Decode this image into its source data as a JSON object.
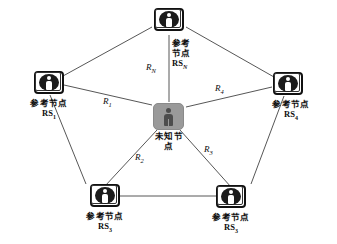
{
  "diagram": {
    "center_node": {
      "icon": "unknown-person-icon",
      "label_line1": "未知节",
      "label_line2": "点",
      "fill_color": "#9a9a9a",
      "figure_color": "#4d4d4d"
    },
    "reference_nodes": [
      {
        "id": "rs-n",
        "position": "top",
        "icon": "reference-person-icon",
        "label_line1": "参考",
        "label_line2": "节点",
        "label_id_base": "RS",
        "label_id_sub": "N"
      },
      {
        "id": "rs-1",
        "position": "left",
        "icon": "reference-person-icon",
        "label_line1": "参考节点",
        "label_line2": "",
        "label_id_base": "RS",
        "label_id_sub": "1"
      },
      {
        "id": "rs-4",
        "position": "right",
        "icon": "reference-person-icon",
        "label_line1": "参考节点",
        "label_line2": "",
        "label_id_base": "RS",
        "label_id_sub": "4"
      },
      {
        "id": "rs-3-left",
        "position": "bottom-left",
        "icon": "reference-person-icon",
        "label_line1": "参考节点",
        "label_line2": "",
        "label_id_base": "RS",
        "label_id_sub": "3"
      },
      {
        "id": "rs-3-right",
        "position": "bottom-right",
        "icon": "reference-person-icon",
        "label_line1": "参考节点",
        "label_line2": "",
        "label_id_base": "RS",
        "label_id_sub": "3"
      }
    ],
    "range_labels": [
      {
        "id": "r-n",
        "base": "R",
        "sub": "N"
      },
      {
        "id": "r-1",
        "base": "R",
        "sub": "1"
      },
      {
        "id": "r-2",
        "base": "R",
        "sub": "2"
      },
      {
        "id": "r-3",
        "base": "R",
        "sub": "3"
      },
      {
        "id": "r-4",
        "base": "R",
        "sub": "4"
      }
    ],
    "edge_color": "#2b2b2b"
  }
}
